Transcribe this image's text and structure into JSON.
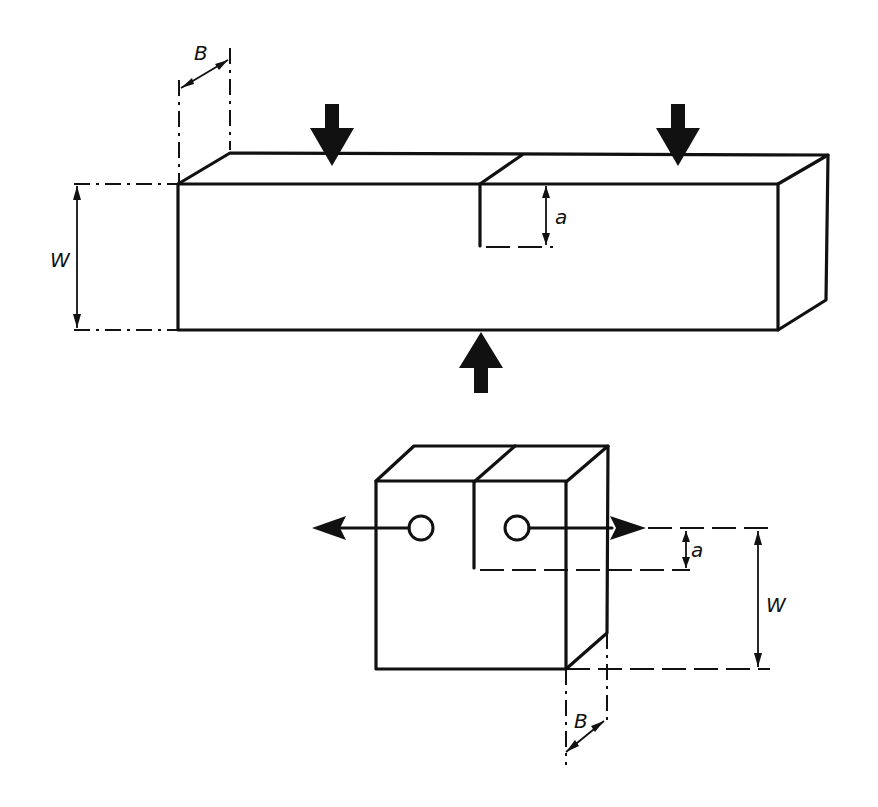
{
  "diagram": {
    "type": "technical-drawing",
    "specimens": [
      {
        "name": "single-edge-notched-bend-specimen",
        "loading": "three-point bending",
        "load_arrows": [
          "down-left",
          "down-right",
          "up-center"
        ],
        "labels": {
          "thickness": "B",
          "width": "W",
          "crack_length": "a"
        }
      },
      {
        "name": "compact-tension-specimen",
        "loading": "pin tension via two holes",
        "load_arrows": [
          "left",
          "right"
        ],
        "labels": {
          "thickness": "B",
          "width": "W",
          "crack_length": "a"
        }
      }
    ],
    "colors": {
      "line": "#111111",
      "background": "#ffffff"
    }
  }
}
